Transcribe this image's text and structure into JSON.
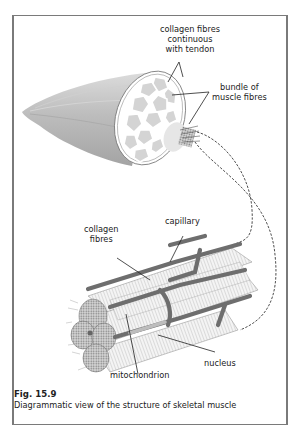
{
  "figure": {
    "number": "Fig. 15.9",
    "caption": "Diagrammatic view of the structure of skeletal muscle"
  },
  "labels": {
    "collagen_tendon": [
      "collagen fibres",
      "continuous",
      "with tendon"
    ],
    "bundle": [
      "bundle of",
      "muscle fibres"
    ],
    "capillary": "capillary",
    "collagen_fibres": [
      "collagen",
      "fibres"
    ],
    "nucleus": "nucleus",
    "mitochondrion": "mitochondrion"
  },
  "colors": {
    "frame": "#7a7a7a",
    "muscle_shade": "#b8b8b8",
    "capillary": "#6e6e6e",
    "fibre": "#e8e8e8",
    "text": "#222222"
  }
}
